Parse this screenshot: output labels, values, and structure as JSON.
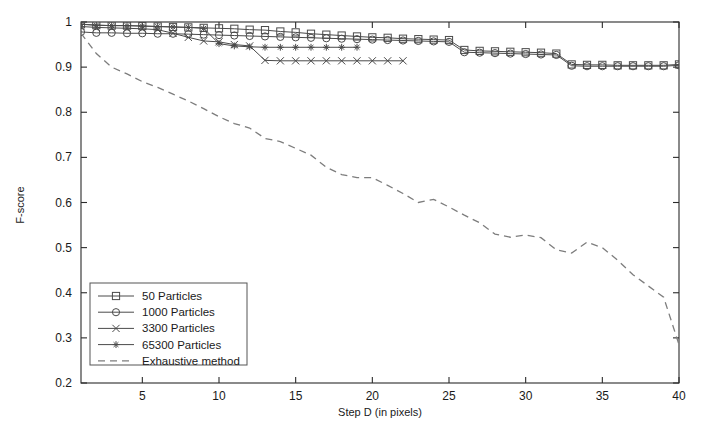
{
  "chart_data": {
    "type": "line",
    "title": "",
    "subtitle": "",
    "xlabel": "Step D (in pixels)",
    "ylabel": "F-score",
    "xlim": [
      1,
      40
    ],
    "ylim": [
      0.2,
      1.0
    ],
    "xticks": [
      5,
      10,
      15,
      20,
      25,
      30,
      35,
      40
    ],
    "yticks": [
      0.2,
      0.3,
      0.4,
      0.5,
      0.6,
      0.7,
      0.8,
      0.9,
      1
    ],
    "xtick_labels": [
      "5",
      "10",
      "15",
      "20",
      "25",
      "30",
      "35",
      "40"
    ],
    "ytick_labels": [
      "0.2",
      "0.3",
      "0.4",
      "0.5",
      "0.6",
      "0.7",
      "0.8",
      "0.9",
      "1"
    ],
    "grid": false,
    "legend_position": "lower left",
    "series": [
      {
        "name": "50 Particles",
        "marker": "square",
        "linestyle": "solid",
        "color": "#4a4a4a",
        "x": [
          1,
          2,
          3,
          4,
          5,
          6,
          7,
          8,
          9,
          10,
          11,
          12,
          13,
          14,
          15,
          16,
          17,
          18,
          19,
          20,
          21,
          22,
          23,
          24,
          25,
          26,
          27,
          28,
          29,
          30,
          31,
          32,
          33,
          34,
          35,
          36,
          37,
          38,
          39,
          40
        ],
        "y": [
          0.995,
          0.993,
          0.992,
          0.992,
          0.991,
          0.99,
          0.989,
          0.988,
          0.987,
          0.986,
          0.985,
          0.983,
          0.982,
          0.979,
          0.977,
          0.974,
          0.972,
          0.97,
          0.968,
          0.966,
          0.965,
          0.963,
          0.962,
          0.961,
          0.96,
          0.938,
          0.936,
          0.935,
          0.934,
          0.933,
          0.932,
          0.93,
          0.906,
          0.905,
          0.905,
          0.904,
          0.904,
          0.904,
          0.904,
          0.906
        ]
      },
      {
        "name": "1000 Particles",
        "marker": "circle",
        "linestyle": "solid",
        "color": "#4a4a4a",
        "x": [
          1,
          2,
          3,
          4,
          5,
          6,
          7,
          8,
          9,
          10,
          11,
          12,
          13,
          14,
          15,
          16,
          17,
          18,
          19,
          20,
          21,
          22,
          23,
          24,
          25,
          26,
          27,
          28,
          29,
          30,
          31,
          32,
          33,
          34,
          35,
          36,
          37,
          38,
          39,
          40
        ],
        "y": [
          0.978,
          0.976,
          0.976,
          0.975,
          0.975,
          0.974,
          0.974,
          0.973,
          0.972,
          0.971,
          0.97,
          0.969,
          0.968,
          0.967,
          0.966,
          0.965,
          0.964,
          0.963,
          0.962,
          0.961,
          0.96,
          0.959,
          0.958,
          0.957,
          0.956,
          0.933,
          0.932,
          0.931,
          0.93,
          0.929,
          0.928,
          0.927,
          0.903,
          0.902,
          0.902,
          0.902,
          0.902,
          0.902,
          0.902,
          0.904
        ]
      },
      {
        "name": "3300 Particles",
        "marker": "x",
        "linestyle": "solid",
        "color": "#4a4a4a",
        "x": [
          1,
          2,
          3,
          4,
          5,
          6,
          7,
          8,
          9,
          10,
          11,
          12,
          13,
          14,
          15,
          16,
          17,
          18,
          19,
          20,
          21,
          22
        ],
        "y": [
          0.99,
          0.988,
          0.987,
          0.986,
          0.985,
          0.983,
          0.975,
          0.966,
          0.958,
          0.956,
          0.95,
          0.947,
          0.915,
          0.914,
          0.914,
          0.914,
          0.914,
          0.914,
          0.914,
          0.914,
          0.914,
          0.914
        ]
      },
      {
        "name": "65300 Particles",
        "marker": "asterisk",
        "linestyle": "solid",
        "color": "#4a4a4a",
        "x": [
          1,
          2,
          3,
          4,
          5,
          6,
          7,
          8,
          9,
          10,
          11,
          12,
          13,
          14,
          15,
          16,
          17,
          18,
          19
        ],
        "y": [
          0.995,
          0.993,
          0.992,
          0.992,
          0.991,
          0.99,
          0.989,
          0.988,
          0.986,
          0.952,
          0.947,
          0.945,
          0.944,
          0.944,
          0.944,
          0.944,
          0.944,
          0.944,
          0.944
        ]
      },
      {
        "name": "Exhaustive method",
        "marker": "none",
        "linestyle": "dashed",
        "color": "#7d7d7d",
        "x": [
          1,
          2,
          3,
          4,
          5,
          6,
          7,
          8,
          9,
          10,
          11,
          12,
          13,
          14,
          15,
          16,
          17,
          18,
          19,
          20,
          21,
          22,
          23,
          24,
          25,
          26,
          27,
          28,
          29,
          30,
          31,
          32,
          33,
          34,
          35,
          36,
          37,
          38,
          39,
          40
        ],
        "y": [
          0.975,
          0.93,
          0.9,
          0.885,
          0.868,
          0.855,
          0.84,
          0.825,
          0.808,
          0.79,
          0.775,
          0.765,
          0.742,
          0.735,
          0.72,
          0.705,
          0.678,
          0.662,
          0.655,
          0.655,
          0.638,
          0.62,
          0.6,
          0.607,
          0.59,
          0.572,
          0.555,
          0.53,
          0.523,
          0.528,
          0.522,
          0.495,
          0.488,
          0.512,
          0.5,
          0.472,
          0.44,
          0.415,
          0.39,
          0.285
        ]
      }
    ]
  },
  "legend": {
    "entries": [
      {
        "label": "50 Particles",
        "marker": "square"
      },
      {
        "label": "1000 Particles",
        "marker": "circle"
      },
      {
        "label": "3300 Particles",
        "marker": "x"
      },
      {
        "label": "65300 Particles",
        "marker": "asterisk"
      },
      {
        "label": "Exhaustive method",
        "marker": "none"
      }
    ]
  },
  "colors": {
    "line": "#4a4a4a",
    "dashed": "#7d7d7d",
    "axis": "#2b2b2b",
    "background": "#ffffff",
    "text": "#1a1a1a"
  }
}
